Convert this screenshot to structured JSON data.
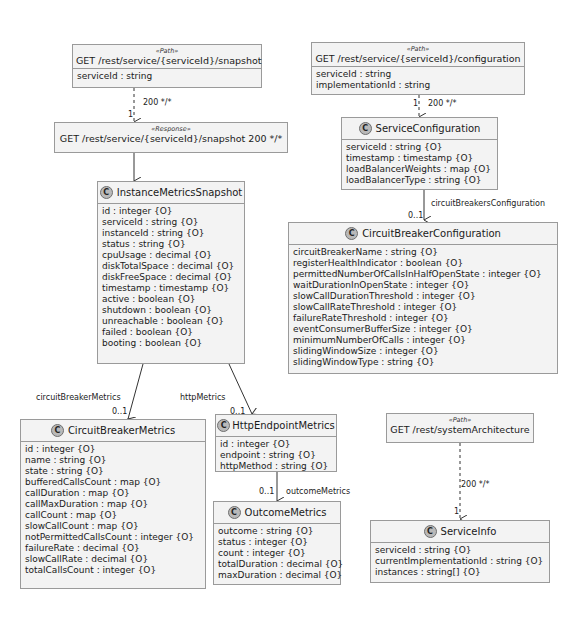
{
  "diagram": {
    "snapshot_path": {
      "stereotype": "«Path»",
      "title": "GET /rest/service/{serviceId}/snapshot",
      "attributes": [
        "serviceId : string"
      ]
    },
    "snapshot_response": {
      "stereotype": "«Response»",
      "title": "GET /rest/service/{serviceId}/snapshot 200 */*"
    },
    "instance_metrics_snapshot": {
      "icon": "C",
      "title": "InstanceMetricsSnapshot",
      "attributes": [
        "id : integer {O}",
        "serviceId : string {O}",
        "instanceId : string {O}",
        "status : string {O}",
        "cpuUsage : decimal {O}",
        "diskTotalSpace : decimal {O}",
        "diskFreeSpace : decimal {O}",
        "timestamp : timestamp {O}",
        "active : boolean {O}",
        "shutdown : boolean {O}",
        "unreachable : boolean {O}",
        "failed : boolean {O}",
        "booting : boolean {O}"
      ]
    },
    "circuit_breaker_metrics": {
      "icon": "C",
      "title": "CircuitBreakerMetrics",
      "attributes": [
        "id : integer {O}",
        "name : string {O}",
        "state : string {O}",
        "bufferedCallsCount : map {O}",
        "callDuration : map {O}",
        "callMaxDuration : map {O}",
        "callCount : map {O}",
        "slowCallCount : map {O}",
        "notPermittedCallsCount : integer {O}",
        "failureRate : decimal {O}",
        "slowCallRate : decimal {O}",
        "totalCallsCount : integer {O}"
      ]
    },
    "http_endpoint_metrics": {
      "icon": "C",
      "title": "HttpEndpointMetrics",
      "attributes": [
        "id : integer {O}",
        "endpoint : string {O}",
        "httpMethod : string {O}"
      ]
    },
    "outcome_metrics": {
      "icon": "C",
      "title": "OutcomeMetrics",
      "attributes": [
        "outcome : string {O}",
        "status : integer {O}",
        "count : integer {O}",
        "totalDuration : decimal {O}",
        "maxDuration : decimal {O}"
      ]
    },
    "configuration_path": {
      "stereotype": "«Path»",
      "title": "GET /rest/service/{serviceId}/configuration",
      "attributes": [
        "serviceId : string",
        "implementationId : string"
      ]
    },
    "service_configuration": {
      "icon": "C",
      "title": "ServiceConfiguration",
      "attributes": [
        "serviceId : string {O}",
        "timestamp : timestamp {O}",
        "loadBalancerWeights : map {O}",
        "loadBalancerType : string {O}"
      ]
    },
    "circuit_breaker_configuration": {
      "icon": "C",
      "title": "CircuitBreakerConfiguration",
      "attributes": [
        "circuitBreakerName : string {O}",
        "registerHealthIndicator : boolean {O}",
        "permittedNumberOfCallsInHalfOpenState : integer {O}",
        "waitDurationInOpenState : integer {O}",
        "slowCallDurationThreshold : integer {O}",
        "slowCallRateThreshold : integer {O}",
        "failureRateThreshold : integer {O}",
        "eventConsumerBufferSize : integer {O}",
        "minimumNumberOfCalls : integer {O}",
        "slidingWindowSize : integer {O}",
        "slidingWindowType : string {O}"
      ]
    },
    "system_architecture_path": {
      "stereotype": "«Path»",
      "title": "GET /rest/systemArchitecture"
    },
    "service_info": {
      "icon": "C",
      "title": "ServiceInfo",
      "attributes": [
        "serviceId : string {O}",
        "currentImplementationId : string {O}",
        "instances : string[] {O}"
      ]
    }
  },
  "edges": {
    "snapshot_response_label": "200 */*",
    "snapshot_response_mult": "1",
    "snapshot_to_class_mult": "1",
    "config_response_label": "200 */*",
    "config_response_mult": "1",
    "circuit_breakers_configuration_label": "circuitBreakersConfiguration",
    "circuit_breakers_configuration_mult": "0..1",
    "circuit_breaker_metrics_label": "circuitBreakerMetrics",
    "circuit_breaker_metrics_mult": "0..1",
    "http_metrics_label": "httpMetrics",
    "http_metrics_mult": "0..1",
    "outcome_metrics_label": "outcomeMetrics",
    "outcome_metrics_mult": "0..1",
    "system_arch_response_label": "200 */*",
    "system_arch_response_mult": "1"
  },
  "colors": {
    "box_fill": "#f3f3f3",
    "box_border": "#9a9a9a",
    "class_icon": "#b9b9b9",
    "line": "#333333"
  }
}
